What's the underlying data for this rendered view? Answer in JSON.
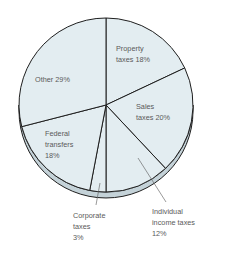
{
  "chart_data": {
    "type": "pie",
    "title": "",
    "slices": [
      {
        "label": "Property taxes",
        "value": 18,
        "label_lines": [
          "Property",
          "taxes 18%"
        ]
      },
      {
        "label": "Sales taxes",
        "value": 20,
        "label_lines": [
          "Sales",
          "taxes 20%"
        ]
      },
      {
        "label": "Individual income taxes",
        "value": 12,
        "label_lines": [
          "Individual",
          "income taxes",
          "12%"
        ]
      },
      {
        "label": "Corporate taxes",
        "value": 3,
        "label_lines": [
          "Corporate",
          "taxes",
          "3%"
        ]
      },
      {
        "label": "Federal transfers",
        "value": 18,
        "label_lines": [
          "Federal",
          "transfers",
          "18%"
        ]
      },
      {
        "label": "Other",
        "value": 29,
        "label_lines": [
          "Other 29%"
        ]
      }
    ],
    "start": "top",
    "direction": "clockwise",
    "style": "3d-tilted",
    "colors": {
      "face": "#e3edf1",
      "rim": "#c4d2d8",
      "outline": "#1e1e1e",
      "text": "#5a5a5a",
      "leader": "#555555"
    }
  }
}
